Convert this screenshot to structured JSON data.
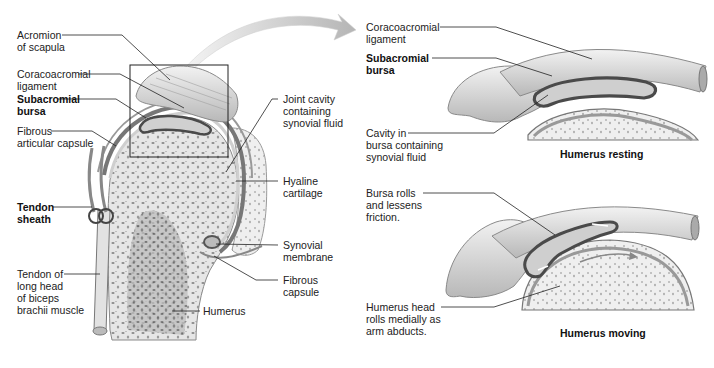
{
  "diagram": {
    "palette": {
      "background": "#ffffff",
      "ink": "#222222",
      "bone": "#d8d8d8",
      "bursa": "#555555",
      "arrow": "#c8c8c8"
    }
  },
  "left_panel": {
    "labels_left": [
      {
        "id": "acromion",
        "text": "Acromion\nof scapula",
        "bold": false
      },
      {
        "id": "coracoacromial",
        "text": "Coracoacromial\nligament",
        "bold": false
      },
      {
        "id": "subacromial",
        "text": "Subacromial\nbursa",
        "bold": true
      },
      {
        "id": "fibrous-articular",
        "text": "Fibrous\narticular capsule",
        "bold": false
      },
      {
        "id": "tendon-sheath",
        "text": "Tendon\nsheath",
        "bold": true
      },
      {
        "id": "biceps-tendon",
        "text": "Tendon of\nlong head\nof biceps\nbrachii muscle",
        "bold": false
      }
    ],
    "labels_right": [
      {
        "id": "joint-cavity",
        "text": "Joint cavity\ncontaining\nsynovial fluid",
        "bold": false
      },
      {
        "id": "hyaline",
        "text": "Hyaline\ncartilage",
        "bold": false
      },
      {
        "id": "synovial-membrane",
        "text": "Synovial\nmembrane",
        "bold": false
      },
      {
        "id": "fibrous-capsule",
        "text": "Fibrous\ncapsule",
        "bold": false
      },
      {
        "id": "humerus",
        "text": "Humerus",
        "bold": false
      }
    ]
  },
  "top_right_panel": {
    "labels": [
      {
        "id": "coracoacromial",
        "text": "Coracoacromial\nligament",
        "bold": false
      },
      {
        "id": "subacromial",
        "text": "Subacromial\nbursa",
        "bold": true
      },
      {
        "id": "cavity",
        "text": "Cavity in\nbursa containing\nsynovial fluid",
        "bold": false
      }
    ],
    "caption": "Humerus resting"
  },
  "bottom_right_panel": {
    "labels": [
      {
        "id": "bursa-rolls",
        "text": "Bursa rolls\nand lessens\nfriction.",
        "bold": false
      },
      {
        "id": "humerus-head",
        "text": "Humerus head\nrolls medially as\narm abducts.",
        "bold": false
      }
    ],
    "caption": "Humerus moving"
  }
}
